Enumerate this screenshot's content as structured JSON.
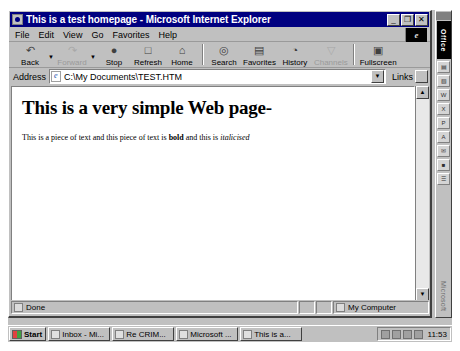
{
  "window": {
    "title": "This is a test homepage - Microsoft Internet Explorer",
    "icon": "ie-document-icon",
    "controls": {
      "minimize": "_",
      "restore": "❐",
      "close": "✕"
    }
  },
  "menubar": {
    "items": [
      {
        "label": "File",
        "accel": "F"
      },
      {
        "label": "Edit",
        "accel": "E"
      },
      {
        "label": "View",
        "accel": "V"
      },
      {
        "label": "Go",
        "accel": "G"
      },
      {
        "label": "Favorites",
        "accel": "a"
      },
      {
        "label": "Help",
        "accel": "H"
      }
    ],
    "brand_logo": "e"
  },
  "toolbar": {
    "buttons": [
      {
        "label": "Back",
        "icon": "back-arrow-icon",
        "glyph": "↶",
        "disabled": false,
        "dropdown": true
      },
      {
        "label": "Forward",
        "icon": "forward-arrow-icon",
        "glyph": "↷",
        "disabled": true,
        "dropdown": true
      },
      {
        "label": "Stop",
        "icon": "stop-icon",
        "glyph": "●",
        "disabled": false,
        "dropdown": false
      },
      {
        "label": "Refresh",
        "icon": "refresh-icon",
        "glyph": "□",
        "disabled": false,
        "dropdown": false
      },
      {
        "label": "Home",
        "icon": "home-icon",
        "glyph": "⌂",
        "disabled": false,
        "dropdown": false
      },
      {
        "label": "Search",
        "icon": "search-icon",
        "glyph": "◎",
        "disabled": false,
        "dropdown": false
      },
      {
        "label": "Favorites",
        "icon": "favorites-folder-icon",
        "glyph": "▤",
        "disabled": false,
        "dropdown": false
      },
      {
        "label": "History",
        "icon": "history-globe-icon",
        "glyph": "◔",
        "disabled": false,
        "dropdown": false
      },
      {
        "label": "Channels",
        "icon": "channels-icon",
        "glyph": "▽",
        "disabled": true,
        "dropdown": false
      },
      {
        "label": "Fullscreen",
        "icon": "fullscreen-icon",
        "glyph": "▣",
        "disabled": false,
        "dropdown": false
      }
    ]
  },
  "addressbar": {
    "label": "Address",
    "value": "C:\\My Documents\\TEST.HTM",
    "placeholder": "Address",
    "dropdown_glyph": "▼",
    "links_label": "Links"
  },
  "page": {
    "heading": "This is a very simple Web page-",
    "paragraph": {
      "part1": "This is a piece of text and this piece of text is ",
      "bold": "bold",
      "part2": " and this is ",
      "italic": "italicised"
    }
  },
  "scrollbar": {
    "up_glyph": "▲",
    "down_glyph": "▼"
  },
  "statusbar": {
    "message": "Done",
    "zone": "My Computer"
  },
  "office_bar": {
    "title": "Office",
    "footer": "Microsoft",
    "icons": [
      {
        "name": "new-office-document-icon",
        "glyph": "▤"
      },
      {
        "name": "open-office-document-icon",
        "glyph": "▧"
      },
      {
        "name": "word-icon",
        "glyph": "W"
      },
      {
        "name": "excel-icon",
        "glyph": "X"
      },
      {
        "name": "powerpoint-icon",
        "glyph": "P"
      },
      {
        "name": "access-icon",
        "glyph": "A"
      },
      {
        "name": "outlook-icon",
        "glyph": "✉"
      },
      {
        "name": "binder-icon",
        "glyph": "■"
      },
      {
        "name": "bookshelf-icon",
        "glyph": "☰"
      }
    ]
  },
  "taskbar": {
    "start_label": "Start",
    "tasks": [
      {
        "label": "Inbox - Mi...",
        "icon": "mail-inbox-icon"
      },
      {
        "label": "Re CRIM...",
        "icon": "mail-message-icon"
      },
      {
        "label": "Microsoft ...",
        "icon": "word-document-icon"
      },
      {
        "label": "This is a...",
        "icon": "ie-document-icon"
      }
    ],
    "tray_icons": [
      "volume-icon",
      "display-icon",
      "modem-icon",
      "mail-icon"
    ],
    "clock": "11:53"
  },
  "colors": {
    "titlebar": "#000080",
    "chrome": "#c0c0c0",
    "page_bg": "#ffffff"
  }
}
